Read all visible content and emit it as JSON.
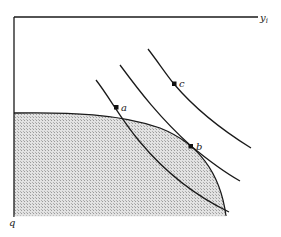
{
  "diagram": {
    "type": "production-possibility-frontier-with-indifference-curves",
    "axes": {
      "horizontal_label": "y",
      "horizontal_label_subscript": "i",
      "vertical_label": "q"
    },
    "points": [
      {
        "id": "a",
        "label": "a"
      },
      {
        "id": "b",
        "label": "b"
      },
      {
        "id": "c",
        "label": "c"
      }
    ],
    "curves": [
      {
        "id": "frontier",
        "kind": "feasible set boundary (shaded)"
      },
      {
        "id": "curve-a",
        "kind": "indifference curve through a"
      },
      {
        "id": "curve-b",
        "kind": "indifference curve through b, tangent to frontier"
      },
      {
        "id": "curve-c",
        "kind": "indifference curve through c"
      }
    ],
    "colors": {
      "line": "#1a1a1a",
      "shade": "#c8c8c8",
      "background": "#ffffff"
    }
  }
}
